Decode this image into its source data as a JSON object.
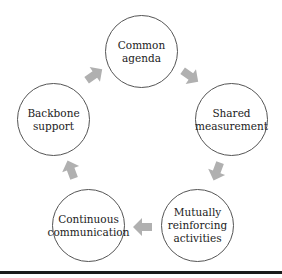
{
  "diagram": {
    "type": "cycle",
    "nodes": [
      {
        "id": "common-agenda",
        "lines": [
          "Common",
          "agenda"
        ]
      },
      {
        "id": "shared-measurement",
        "lines": [
          "Shared",
          "measurement"
        ]
      },
      {
        "id": "mutually-reinforcing-activities",
        "lines": [
          "Mutually",
          "reinforcing",
          "activities"
        ]
      },
      {
        "id": "continuous-communication",
        "lines": [
          "Continuous",
          "communication"
        ]
      },
      {
        "id": "backbone-support",
        "lines": [
          "Backbone",
          "support"
        ]
      }
    ],
    "edges": [
      {
        "from": "common-agenda",
        "to": "shared-measurement"
      },
      {
        "from": "shared-measurement",
        "to": "mutually-reinforcing-activities"
      },
      {
        "from": "mutually-reinforcing-activities",
        "to": "continuous-communication"
      },
      {
        "from": "continuous-communication",
        "to": "backbone-support"
      },
      {
        "from": "backbone-support",
        "to": "common-agenda"
      }
    ],
    "colors": {
      "arrow": "#b0b0b0",
      "circle_border": "#555555",
      "rule": "#1a1a1a"
    }
  }
}
